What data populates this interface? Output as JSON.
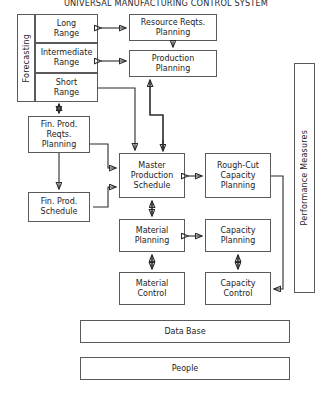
{
  "diagram": {
    "title": "UNIVERSAL MANUFACTURING CONTROL SYSTEM",
    "type": "block-flow-diagram",
    "forecasting_group": {
      "label": "Forecasting",
      "items": [
        {
          "label": "Long\nRange"
        },
        {
          "label": "Intermediate\nRange"
        },
        {
          "label": "Short\nRange"
        }
      ]
    },
    "boxes": {
      "long_range": "Long Range",
      "intermediate_range": "Intermediate Range",
      "short_range": "Short Range",
      "resource_reqts_planning": "Resource Reqts. Planning",
      "production_planning": "Production Planning",
      "fin_prod_reqts_planning": "Fin. Prod. Reqts. Planning",
      "fin_prod_schedule": "Fin. Prod. Schedule",
      "master_production_schedule": "Master Production Schedule",
      "rough_cut_capacity_planning": "Rough-Cut Capacity Planning",
      "material_planning": "Material Planning",
      "capacity_planning": "Capacity Planning",
      "material_control": "Material Control",
      "capacity_control": "Capacity Control",
      "performance_measures": "Performance Measures",
      "data_base": "Data Base",
      "people": "People"
    },
    "colors": {
      "background": "#ffffff",
      "box_border": "#5a5a5a",
      "connector": "#2b2b2b",
      "text": "#1c1c1c"
    }
  }
}
